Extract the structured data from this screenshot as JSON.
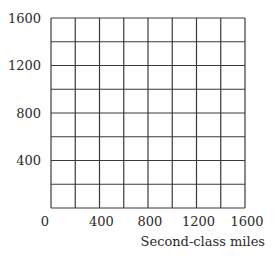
{
  "chart_data": {
    "type": "line",
    "title": "",
    "xlabel": "Second-class miles",
    "ylabel": "",
    "xlim": [
      0,
      1600
    ],
    "ylim": [
      0,
      1600
    ],
    "x_ticks": [
      0,
      400,
      800,
      1200,
      1600
    ],
    "y_ticks": [
      400,
      800,
      1200,
      1600
    ],
    "x_tick_labels": [
      "0",
      "400",
      "800",
      "1200",
      "1600"
    ],
    "y_tick_labels": [
      "400",
      "800",
      "1200",
      "1600"
    ],
    "grid": true,
    "grid_step": 200,
    "grid_columns": 8,
    "grid_rows": 8,
    "series": [],
    "legend": null
  },
  "colors": {
    "grid_line": "#3a3a3a",
    "text": "#2a2a2a",
    "background": "#ffffff"
  }
}
